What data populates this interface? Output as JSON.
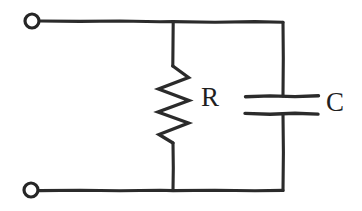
{
  "figure": {
    "kind": "circuit-diagram",
    "background_color": "#ffffff",
    "ink_color": "#2b2b2b"
  },
  "labels": {
    "resistor": "R",
    "capacitor": "C"
  },
  "components": [
    {
      "id": "terminal-top",
      "type": "terminal",
      "symbol": "open-circle",
      "cx": 32,
      "cy": 21,
      "r": 7
    },
    {
      "id": "terminal-bottom",
      "type": "terminal",
      "symbol": "open-circle",
      "cx": 31,
      "cy": 190,
      "r": 7
    },
    {
      "id": "resistor",
      "type": "resistor",
      "symbol": "zigzag",
      "label": "R",
      "branch_x": 173,
      "top_y": 22,
      "bottom_y": 190
    },
    {
      "id": "capacitor",
      "type": "capacitor",
      "symbol": "parallel-plates",
      "label": "C",
      "branch_x": 283,
      "top_y": 22,
      "bottom_y": 190,
      "plate_top_y": 96,
      "plate_bottom_y": 114,
      "plate_x1": 245,
      "plate_x2": 318
    },
    {
      "id": "wire-top",
      "type": "wire",
      "from": "terminal-top",
      "to": "capacitor-top"
    },
    {
      "id": "wire-bottom",
      "type": "wire",
      "from": "terminal-bottom",
      "to": "capacitor-bottom"
    }
  ],
  "geometry": {
    "top_rail_y": 22,
    "bottom_rail_y": 190,
    "left_x": 40,
    "right_x": 283
  }
}
